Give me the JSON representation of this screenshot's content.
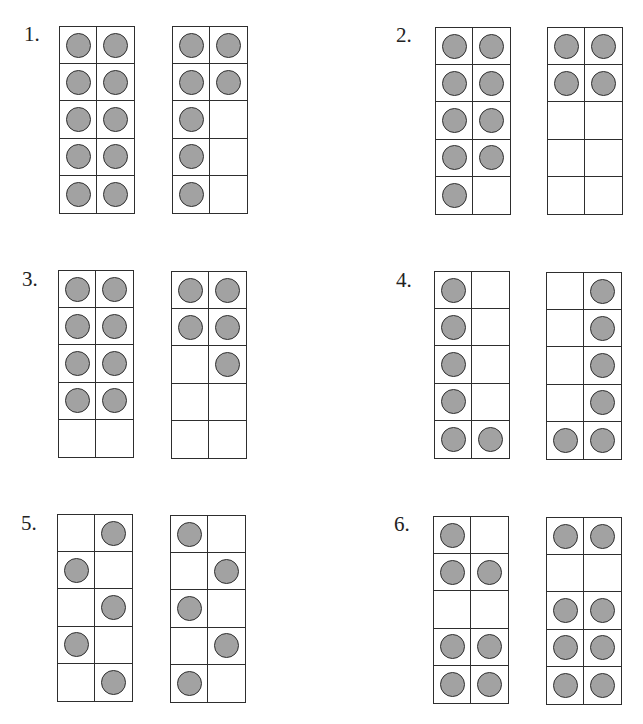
{
  "worksheet": {
    "problems": [
      {
        "number": "1.",
        "frames": [
          {
            "grid": [
              [
                1,
                1
              ],
              [
                1,
                1
              ],
              [
                1,
                1
              ],
              [
                1,
                1
              ],
              [
                1,
                1
              ]
            ],
            "count": 10
          },
          {
            "grid": [
              [
                1,
                1
              ],
              [
                1,
                1
              ],
              [
                1,
                0
              ],
              [
                1,
                0
              ],
              [
                1,
                0
              ]
            ],
            "count": 7
          }
        ]
      },
      {
        "number": "2.",
        "frames": [
          {
            "grid": [
              [
                1,
                1
              ],
              [
                1,
                1
              ],
              [
                1,
                1
              ],
              [
                1,
                1
              ],
              [
                1,
                0
              ]
            ],
            "count": 9
          },
          {
            "grid": [
              [
                1,
                1
              ],
              [
                1,
                1
              ],
              [
                0,
                0
              ],
              [
                0,
                0
              ],
              [
                0,
                0
              ]
            ],
            "count": 4
          }
        ]
      },
      {
        "number": "3.",
        "frames": [
          {
            "grid": [
              [
                1,
                1
              ],
              [
                1,
                1
              ],
              [
                1,
                1
              ],
              [
                1,
                1
              ],
              [
                0,
                0
              ]
            ],
            "count": 8
          },
          {
            "grid": [
              [
                1,
                1
              ],
              [
                1,
                1
              ],
              [
                0,
                1
              ],
              [
                0,
                0
              ],
              [
                0,
                0
              ]
            ],
            "count": 5
          }
        ]
      },
      {
        "number": "4.",
        "frames": [
          {
            "grid": [
              [
                1,
                0
              ],
              [
                1,
                0
              ],
              [
                1,
                0
              ],
              [
                1,
                0
              ],
              [
                1,
                1
              ]
            ],
            "count": 6
          },
          {
            "grid": [
              [
                0,
                1
              ],
              [
                0,
                1
              ],
              [
                0,
                1
              ],
              [
                0,
                1
              ],
              [
                1,
                1
              ]
            ],
            "count": 6
          }
        ]
      },
      {
        "number": "5.",
        "frames": [
          {
            "grid": [
              [
                0,
                1
              ],
              [
                1,
                0
              ],
              [
                0,
                1
              ],
              [
                1,
                0
              ],
              [
                0,
                1
              ]
            ],
            "count": 5
          },
          {
            "grid": [
              [
                1,
                0
              ],
              [
                0,
                1
              ],
              [
                1,
                0
              ],
              [
                0,
                1
              ],
              [
                1,
                0
              ]
            ],
            "count": 5
          }
        ]
      },
      {
        "number": "6.",
        "frames": [
          {
            "grid": [
              [
                1,
                0
              ],
              [
                1,
                1
              ],
              [
                0,
                0
              ],
              [
                1,
                1
              ],
              [
                1,
                1
              ]
            ],
            "count": 7
          },
          {
            "grid": [
              [
                1,
                1
              ],
              [
                0,
                0
              ],
              [
                1,
                1
              ],
              [
                1,
                1
              ],
              [
                1,
                1
              ]
            ],
            "count": 8
          }
        ]
      }
    ],
    "colors": {
      "counter_fill": "#a2a2a2",
      "line": "#2e2e2e",
      "background": "#ffffff"
    }
  },
  "layout": {
    "positions": [
      {
        "label": [
          24,
          24
        ],
        "frames": [
          [
            59,
            26
          ],
          [
            172,
            26
          ]
        ]
      },
      {
        "label": [
          396,
          25
        ],
        "frames": [
          [
            435,
            27
          ],
          [
            547,
            27
          ]
        ]
      },
      {
        "label": [
          22,
          269
        ],
        "frames": [
          [
            58,
            270
          ],
          [
            171,
            271
          ]
        ]
      },
      {
        "label": [
          396,
          270
        ],
        "frames": [
          [
            434,
            271
          ],
          [
            546,
            272
          ]
        ]
      },
      {
        "label": [
          21,
          513
        ],
        "frames": [
          [
            57,
            514
          ],
          [
            170,
            515
          ]
        ]
      },
      {
        "label": [
          394,
          514
        ],
        "frames": [
          [
            433,
            516
          ],
          [
            546,
            517
          ]
        ]
      }
    ]
  }
}
